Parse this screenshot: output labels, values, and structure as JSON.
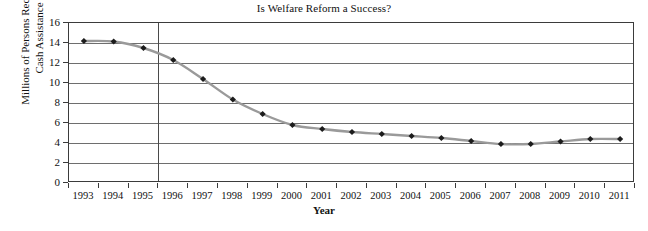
{
  "chart_data": {
    "type": "line",
    "title": "Is Welfare Reform a Success?",
    "xlabel": "Year",
    "ylabel": "Millions of Persons Receiving Cash Assistance",
    "ylabel_line1": "Millions of Persons Receiving",
    "ylabel_line2": "Cash Assistance",
    "categories": [
      "1993",
      "1994",
      "1995",
      "1996",
      "1997",
      "1998",
      "1999",
      "2000",
      "2001",
      "2002",
      "2003",
      "2004",
      "2005",
      "2006",
      "2007",
      "2008",
      "2009",
      "2010",
      "2011"
    ],
    "values": [
      14.2,
      14.15,
      13.5,
      12.3,
      10.4,
      8.35,
      6.9,
      5.8,
      5.4,
      5.1,
      4.9,
      4.7,
      4.5,
      4.2,
      3.9,
      3.9,
      4.15,
      4.4,
      4.4
    ],
    "ylim": [
      0,
      16
    ],
    "ytick_values": [
      0,
      2,
      4,
      6,
      8,
      10,
      12,
      14,
      16
    ],
    "ytick_labels": [
      "0",
      "2",
      "4",
      "6",
      "8",
      "10",
      "12",
      "14",
      "16"
    ],
    "grid": "horizontal",
    "legend": "none",
    "marker": "diamond",
    "marker_color": "#1c1c1c",
    "line_color": "#9a9a9a",
    "axis_color": "#3b3b3b",
    "gridline_color": "#6e6e6e",
    "background": "#ffffff",
    "reference_line": {
      "at_category": "1996",
      "color": "#4a4a4a"
    },
    "annotations": []
  }
}
